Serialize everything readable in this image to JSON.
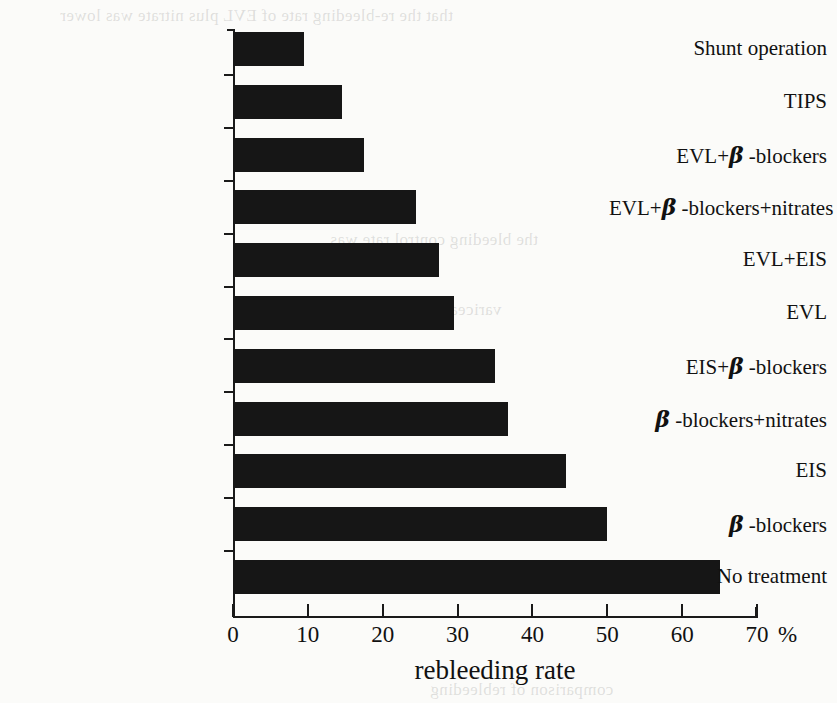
{
  "chart_data": {
    "type": "bar",
    "orientation": "horizontal",
    "title": "",
    "xlabel": "rebleeding rate",
    "ylabel": "",
    "unit": "%",
    "unit_label": "%",
    "xlim": [
      0,
      70
    ],
    "xticks": [
      0,
      10,
      20,
      30,
      40,
      50,
      60,
      70
    ],
    "xtick_labels": [
      "0",
      "10",
      "20",
      "30",
      "40",
      "50",
      "60",
      "70"
    ],
    "grid": false,
    "legend": false,
    "bar_color": "#161616",
    "axis_color": "#1a1a1a",
    "categories": [
      "Shunt operation",
      "TIPS",
      "EVL+β -blockers",
      "EVL+β -blockers+nitrates",
      "EVL+EIS",
      "EVL",
      "EIS+β -blockers",
      "β -blockers+nitrates",
      "EIS",
      "β -blockers",
      "No treatment"
    ],
    "values": [
      9.5,
      14.5,
      17.5,
      24.5,
      27.5,
      29.5,
      35,
      36.7,
      44.5,
      50,
      65
    ],
    "series": [
      {
        "name": "rebleeding rate",
        "values": [
          9.5,
          14.5,
          17.5,
          24.5,
          27.5,
          29.5,
          35,
          36.7,
          44.5,
          50,
          65
        ]
      }
    ]
  },
  "labels": {
    "cat_0": {
      "pre": "Shunt operation",
      "beta": "",
      "post": ""
    },
    "cat_1": {
      "pre": "TIPS",
      "beta": "",
      "post": ""
    },
    "cat_2": {
      "pre": "EVL+",
      "beta": "β",
      "post": " -blockers"
    },
    "cat_3": {
      "pre": "EVL+",
      "beta": "β",
      "post": " -blockers+nitrates"
    },
    "cat_4": {
      "pre": "EVL+EIS",
      "beta": "",
      "post": ""
    },
    "cat_5": {
      "pre": "EVL",
      "beta": "",
      "post": ""
    },
    "cat_6": {
      "pre": "EIS+",
      "beta": "β",
      "post": " -blockers"
    },
    "cat_7": {
      "pre": "",
      "beta": "β",
      "post": " -blockers+nitrates"
    },
    "cat_8": {
      "pre": "EIS",
      "beta": "",
      "post": ""
    },
    "cat_9": {
      "pre": "",
      "beta": "β",
      "post": " -blockers"
    },
    "cat_10": {
      "pre": "No treatment",
      "beta": "",
      "post": ""
    }
  },
  "page_bleed": {
    "line_top": "that the re-bleeding rate of EVL plus nitrate was lower",
    "line_mid1": "the bleeding control rate was",
    "line_mid2": "variceal eradication",
    "line_bottom": "comparison of rebleeding"
  }
}
